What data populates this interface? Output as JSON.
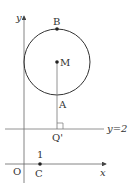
{
  "diagram": {
    "axes": {
      "x_label": "x",
      "y_label": "y",
      "origin_label": "O"
    },
    "circle": {
      "center_label": "M",
      "top_point_label": "B",
      "bottom_point_label": "A"
    },
    "line": {
      "label": "y=2"
    },
    "points": {
      "foot_label": "Q'",
      "c_label": "C",
      "c_tick": "1"
    },
    "colors": {
      "stroke": "#555555",
      "text": "#333333"
    }
  }
}
